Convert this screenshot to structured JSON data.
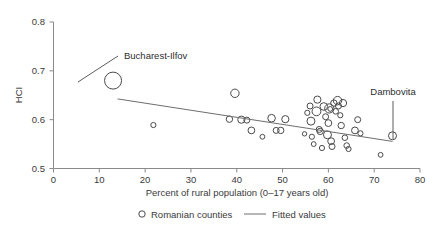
{
  "chart_data": {
    "type": "scatter",
    "title": "",
    "xlabel": "Percent of rural population (0–17 years old)",
    "ylabel": "HCI",
    "xlim": [
      0,
      80
    ],
    "ylim": [
      0.5,
      0.8
    ],
    "xticks": [
      "0",
      "10",
      "20",
      "30",
      "40",
      "50",
      "60",
      "70",
      "80"
    ],
    "xtick_values": [
      0,
      10,
      20,
      30,
      40,
      50,
      60,
      70,
      80
    ],
    "yticks": [
      "0.5",
      "0.6",
      "0.7",
      "0.8"
    ],
    "ytick_values": [
      0.5,
      0.6,
      0.7,
      0.8
    ],
    "grid": false,
    "legend_position": "below-axis",
    "legend": [
      {
        "label": "Romanian counties",
        "marker": "open-circle"
      },
      {
        "label": "Fitted values",
        "marker": "line"
      }
    ],
    "series": [
      {
        "name": "Romanian counties",
        "marker": "open-circle",
        "points": [
          {
            "x": 13.0,
            "y": 0.68,
            "r": 8.5,
            "label": "Bucharest-Ilfov"
          },
          {
            "x": 21.8,
            "y": 0.589,
            "r": 2.6
          },
          {
            "x": 38.4,
            "y": 0.601,
            "r": 3.2
          },
          {
            "x": 39.6,
            "y": 0.654,
            "r": 4.2
          },
          {
            "x": 41.0,
            "y": 0.6,
            "r": 3.6
          },
          {
            "x": 42.2,
            "y": 0.599,
            "r": 3.0
          },
          {
            "x": 43.2,
            "y": 0.578,
            "r": 3.4
          },
          {
            "x": 45.6,
            "y": 0.565,
            "r": 2.4
          },
          {
            "x": 47.6,
            "y": 0.603,
            "r": 3.8
          },
          {
            "x": 48.6,
            "y": 0.578,
            "r": 3.0
          },
          {
            "x": 49.6,
            "y": 0.578,
            "r": 3.2
          },
          {
            "x": 50.6,
            "y": 0.601,
            "r": 3.6
          },
          {
            "x": 54.8,
            "y": 0.571,
            "r": 2.2
          },
          {
            "x": 55.4,
            "y": 0.614,
            "r": 2.6
          },
          {
            "x": 56.0,
            "y": 0.628,
            "r": 3.0
          },
          {
            "x": 56.2,
            "y": 0.597,
            "r": 4.0
          },
          {
            "x": 56.4,
            "y": 0.565,
            "r": 2.6
          },
          {
            "x": 56.8,
            "y": 0.55,
            "r": 2.4
          },
          {
            "x": 57.4,
            "y": 0.617,
            "r": 4.4
          },
          {
            "x": 57.6,
            "y": 0.641,
            "r": 3.6
          },
          {
            "x": 58.0,
            "y": 0.58,
            "r": 3.0
          },
          {
            "x": 58.2,
            "y": 0.576,
            "r": 3.2
          },
          {
            "x": 58.6,
            "y": 0.542,
            "r": 2.6
          },
          {
            "x": 59.0,
            "y": 0.627,
            "r": 3.8
          },
          {
            "x": 59.4,
            "y": 0.606,
            "r": 3.0
          },
          {
            "x": 59.8,
            "y": 0.569,
            "r": 4.0
          },
          {
            "x": 60.0,
            "y": 0.593,
            "r": 3.4
          },
          {
            "x": 60.2,
            "y": 0.623,
            "r": 4.6
          },
          {
            "x": 60.4,
            "y": 0.622,
            "r": 2.4
          },
          {
            "x": 60.6,
            "y": 0.556,
            "r": 3.4
          },
          {
            "x": 60.8,
            "y": 0.545,
            "r": 3.0
          },
          {
            "x": 61.2,
            "y": 0.634,
            "r": 3.2
          },
          {
            "x": 61.6,
            "y": 0.617,
            "r": 2.8
          },
          {
            "x": 62.0,
            "y": 0.639,
            "r": 4.2
          },
          {
            "x": 62.2,
            "y": 0.628,
            "r": 3.0
          },
          {
            "x": 62.6,
            "y": 0.609,
            "r": 2.6
          },
          {
            "x": 62.8,
            "y": 0.588,
            "r": 3.2
          },
          {
            "x": 63.2,
            "y": 0.634,
            "r": 3.6
          },
          {
            "x": 63.6,
            "y": 0.563,
            "r": 2.8
          },
          {
            "x": 64.0,
            "y": 0.547,
            "r": 2.8
          },
          {
            "x": 64.4,
            "y": 0.54,
            "r": 2.6
          },
          {
            "x": 65.8,
            "y": 0.578,
            "r": 3.4
          },
          {
            "x": 66.4,
            "y": 0.6,
            "r": 3.0
          },
          {
            "x": 67.0,
            "y": 0.572,
            "r": 2.6
          },
          {
            "x": 71.4,
            "y": 0.528,
            "r": 2.4
          },
          {
            "x": 74.0,
            "y": 0.567,
            "r": 4.0,
            "label": "Dambovita"
          }
        ]
      },
      {
        "name": "Fitted values",
        "type": "line",
        "points": [
          {
            "x": 14.0,
            "y": 0.6425
          },
          {
            "x": 74.0,
            "y": 0.5555
          }
        ]
      }
    ],
    "annotations": [
      {
        "text": "Bucharest-Ilfov",
        "target_x": 13.0,
        "target_y": 0.68
      },
      {
        "text": "Dambovita",
        "target_x": 74.0,
        "target_y": 0.567
      }
    ]
  }
}
